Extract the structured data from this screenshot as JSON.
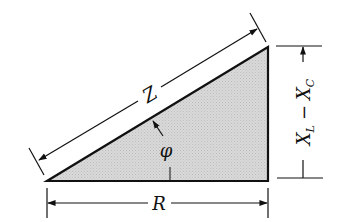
{
  "figure": {
    "colors": {
      "stroke": "#111111",
      "fill": "#d4d4d4",
      "background": "#ffffff"
    },
    "labels": {
      "hypotenuse": "Z",
      "angle": "φ",
      "base": "R",
      "height_main_1": "X",
      "height_sub_1": "L",
      "height_minus": "−",
      "height_main_2": "X",
      "height_sub_2": "C"
    }
  }
}
